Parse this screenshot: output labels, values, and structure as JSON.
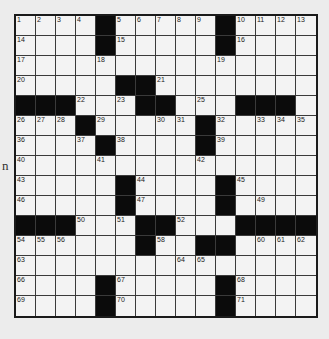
{
  "margin_text": "n",
  "puzzle": {
    "rows": 15,
    "cols": 15,
    "colors": {
      "white": "#f3f3f3",
      "black": "#0b0b0b",
      "line": "#3a3a3a"
    },
    "layout": [
      "....#.....#....",
      "....#.....#....",
      "...............",
      ".....##........",
      "###...##...###.",
      "...#.....#.....",
      "....#....#.....",
      "...............",
      ".....#....#....",
      ".....#....#....",
      "###...##...####",
      "......#..##....",
      "...............",
      "....#.....#....",
      "....#.....#...."
    ],
    "numbers": [
      [
        0,
        0,
        1
      ],
      [
        0,
        1,
        2
      ],
      [
        0,
        2,
        3
      ],
      [
        0,
        3,
        4
      ],
      [
        0,
        5,
        5
      ],
      [
        0,
        6,
        6
      ],
      [
        0,
        7,
        7
      ],
      [
        0,
        8,
        8
      ],
      [
        0,
        9,
        9
      ],
      [
        0,
        11,
        10
      ],
      [
        0,
        12,
        11
      ],
      [
        0,
        13,
        12
      ],
      [
        0,
        14,
        13
      ],
      [
        1,
        0,
        14
      ],
      [
        1,
        5,
        15
      ],
      [
        1,
        11,
        16
      ],
      [
        2,
        0,
        17
      ],
      [
        2,
        4,
        18
      ],
      [
        2,
        10,
        19
      ],
      [
        3,
        0,
        20
      ],
      [
        3,
        7,
        21
      ],
      [
        4,
        3,
        22
      ],
      [
        4,
        5,
        23
      ],
      [
        4,
        6,
        24
      ],
      [
        4,
        9,
        25
      ],
      [
        5,
        0,
        26
      ],
      [
        5,
        1,
        27
      ],
      [
        5,
        2,
        28
      ],
      [
        5,
        4,
        29
      ],
      [
        5,
        7,
        30
      ],
      [
        5,
        8,
        31
      ],
      [
        5,
        10,
        32
      ],
      [
        5,
        12,
        33
      ],
      [
        5,
        13,
        34
      ],
      [
        5,
        14,
        35
      ],
      [
        6,
        0,
        36
      ],
      [
        6,
        3,
        37
      ],
      [
        6,
        5,
        38
      ],
      [
        6,
        10,
        39
      ],
      [
        7,
        0,
        40
      ],
      [
        7,
        4,
        41
      ],
      [
        7,
        9,
        42
      ],
      [
        8,
        0,
        43
      ],
      [
        8,
        6,
        44
      ],
      [
        8,
        11,
        45
      ],
      [
        9,
        0,
        46
      ],
      [
        9,
        6,
        47
      ],
      [
        9,
        10,
        48
      ],
      [
        9,
        12,
        49
      ],
      [
        10,
        3,
        50
      ],
      [
        10,
        5,
        51
      ],
      [
        10,
        8,
        52
      ],
      [
        10,
        11,
        53
      ],
      [
        11,
        0,
        54
      ],
      [
        11,
        1,
        55
      ],
      [
        11,
        2,
        56
      ],
      [
        11,
        6,
        57
      ],
      [
        11,
        7,
        58
      ],
      [
        11,
        10,
        59
      ],
      [
        11,
        12,
        60
      ],
      [
        11,
        13,
        61
      ],
      [
        11,
        14,
        62
      ],
      [
        12,
        0,
        63
      ],
      [
        12,
        8,
        64
      ],
      [
        12,
        9,
        65
      ],
      [
        13,
        0,
        66
      ],
      [
        13,
        5,
        67
      ],
      [
        13,
        11,
        68
      ],
      [
        14,
        0,
        69
      ],
      [
        14,
        5,
        70
      ],
      [
        14,
        11,
        71
      ]
    ]
  }
}
